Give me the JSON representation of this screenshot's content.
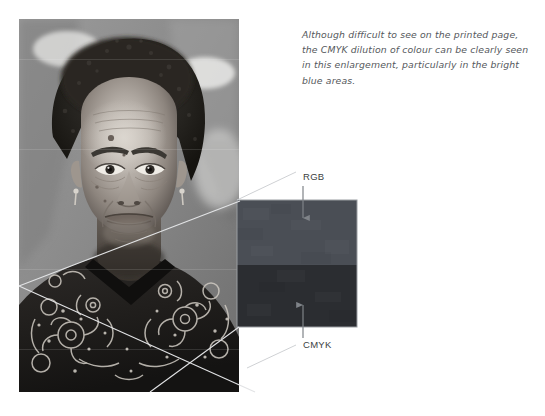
{
  "page": {
    "background_color": "#ffffff",
    "width": 545,
    "height": 416
  },
  "caption": {
    "line1": "Although difficult to see on the printed page,",
    "line2": "the CMYK dilution of colour can be clearly seen",
    "line3": "in this enlargement, particularly in the bright",
    "line4": "blue areas.",
    "text_color": "#55585c",
    "style": "italic"
  },
  "photo": {
    "alt": "Black and white portrait photograph of an elderly woman wearing a patterned floral blouse",
    "subject": "elderly-woman-portrait",
    "rendering": "grayscale"
  },
  "swatch": {
    "top_label": "RGB",
    "bottom_label": "CMYK",
    "top_color": "#4a4e55",
    "bottom_color": "#2b2d31",
    "border_color": "#8d9096"
  },
  "callouts": [
    {
      "label": "RGB",
      "name": "rgb-callout",
      "arrow_direction": "down",
      "target": "swatch-top-half"
    },
    {
      "label": "CMYK",
      "name": "cmyk-callout",
      "arrow_direction": "up",
      "target": "swatch-bottom-half"
    }
  ],
  "leader_lines": {
    "color": "#d9dadd",
    "count": 3,
    "description": "thin diagonal lines linking the photograph detail to the enlarged swatch"
  }
}
